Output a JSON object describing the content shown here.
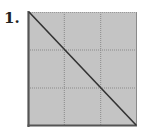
{
  "problem": {
    "number_label": "1."
  },
  "figure": {
    "grid_rows": 3,
    "grid_cols": 3,
    "fill_color": "#c4c4c4",
    "grid_line_color": "#8a8a8a",
    "border_color": "#555555",
    "diagonal": "top-left to bottom-right",
    "diagonal_color": "#333333"
  }
}
